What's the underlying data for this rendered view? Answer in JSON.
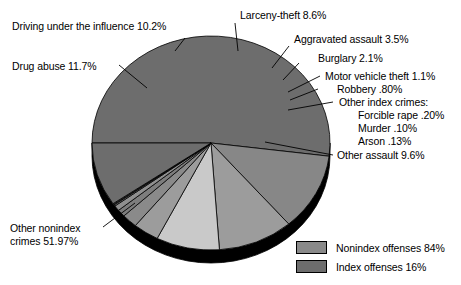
{
  "chart_data": {
    "type": "pie",
    "title": "",
    "subtitle": "",
    "xlabel": "",
    "ylabel": "",
    "legend_position": "bottom-right",
    "grid": false,
    "categories": [
      "Other nonindex crimes",
      "Driving under the influence",
      "Drug abuse",
      "Larceny-theft",
      "Aggravated assault",
      "Burglary",
      "Motor vehicle theft",
      "Robbery",
      "Forcible rape",
      "Murder",
      "Arson",
      "Other assault"
    ],
    "values": [
      51.97,
      10.2,
      11.7,
      8.6,
      3.5,
      2.1,
      1.1,
      0.8,
      0.2,
      0.1,
      0.13,
      9.6
    ],
    "value_labels": [
      "51.97%",
      "10.2%",
      "11.7%",
      "8.6%",
      "3.5%",
      "2.1%",
      "1.1%",
      ".80%",
      ".20%",
      ".10%",
      ".13%",
      "9.6%"
    ],
    "slices": [
      {
        "name": "Other nonindex crimes",
        "value": 51.97,
        "label": "Other nonindex crimes 51.97%",
        "group": "Nonindex offenses",
        "color": "#6d6d6d"
      },
      {
        "name": "Drug abuse",
        "value": 11.7,
        "label": "Drug abuse 11.7%",
        "group": "Nonindex offenses",
        "color": "#878787"
      },
      {
        "name": "Driving under the influence",
        "value": 10.2,
        "label": "Driving under the influence 10.2%",
        "group": "Nonindex offenses",
        "color": "#9c9c9c"
      },
      {
        "name": "Larceny-theft",
        "value": 8.6,
        "label": "Larceny-theft 8.6%",
        "group": "Index offenses",
        "color": "#c9c9c9"
      },
      {
        "name": "Aggravated assault",
        "value": 3.5,
        "label": "Aggravated assault 3.5%",
        "group": "Index offenses",
        "color": "#9c9c9c"
      },
      {
        "name": "Burglary",
        "value": 2.1,
        "label": "Burglary 2.1%",
        "group": "Index offenses",
        "color": "#8a8a8a"
      },
      {
        "name": "Motor vehicle theft",
        "value": 1.1,
        "label": "Motor vehicle theft 1.1%",
        "group": "Index offenses",
        "color": "#7d7d7d"
      },
      {
        "name": "Robbery",
        "value": 0.8,
        "label": "Robbery .80%",
        "group": "Index offenses",
        "color": "#8f8f8f"
      },
      {
        "name": "Forcible rape",
        "value": 0.2,
        "label": "Forcible rape .20%",
        "group": "Index offenses",
        "color": "#787878"
      },
      {
        "name": "Murder",
        "value": 0.1,
        "label": "Murder .10%",
        "group": "Index offenses",
        "color": "#8a8a8a"
      },
      {
        "name": "Arson",
        "value": 0.13,
        "label": "Arson .13%",
        "group": "Index offenses",
        "color": "#757575"
      },
      {
        "name": "Other assault",
        "value": 9.6,
        "label": "Other assault 9.6%",
        "group": "Nonindex offenses",
        "color": "#6d6d6d"
      }
    ],
    "annotations": [
      "Other index crimes:"
    ]
  },
  "labels": {
    "driving_under_influence": "Driving under the influence 10.2%",
    "drug_abuse": "Drug abuse 11.7%",
    "other_nonindex_line1": "Other nonindex",
    "other_nonindex_line2": "crimes 51.97%",
    "larceny_theft": "Larceny-theft 8.6%",
    "aggravated_assault": "Aggravated assault 3.5%",
    "burglary": "Burglary 2.1%",
    "motor_vehicle_theft": "Motor vehicle theft 1.1%",
    "robbery": "Robbery .80%",
    "other_index_crimes_heading": "Other index crimes:",
    "forcible_rape": "Forcible rape .20%",
    "murder": "Murder .10%",
    "arson": "Arson .13%",
    "other_assault": "Other assault 9.6%"
  },
  "legend": {
    "items": [
      {
        "label": "Nonindex offenses 84%",
        "color": "#8a8a8a",
        "value": 84
      },
      {
        "label": "Index offenses 16%",
        "color": "#6d6d6d",
        "value": 16
      }
    ]
  },
  "colors": {
    "background": "#ffffff",
    "outline": "#000000",
    "pie_depth": "#000000",
    "light_slice": "#c9c9c9",
    "mid_slice": "#9c9c9c",
    "dark_slice": "#6d6d6d"
  }
}
